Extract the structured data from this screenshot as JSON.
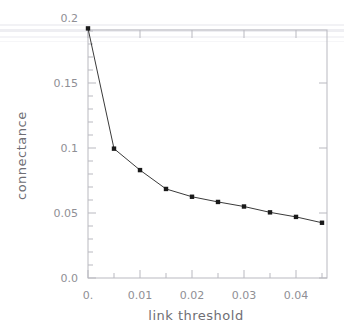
{
  "header": {
    "cut_text": "",
    "right_mark": ""
  },
  "chart_data": {
    "type": "line",
    "title": "",
    "xlabel": "link threshold",
    "ylabel": "connectance",
    "x": [
      0.0,
      0.005,
      0.01,
      0.015,
      0.02,
      0.025,
      0.03,
      0.035,
      0.04,
      0.045
    ],
    "values": [
      0.192,
      0.0995,
      0.083,
      0.0685,
      0.0625,
      0.0585,
      0.055,
      0.0505,
      0.047,
      0.0425
    ],
    "series": [
      {
        "name": "connectance",
        "values": [
          0.192,
          0.0995,
          0.083,
          0.0685,
          0.0625,
          0.0585,
          0.055,
          0.0505,
          0.047,
          0.0425
        ]
      }
    ],
    "xlim": [
      -0.004,
      0.0465
    ],
    "ylim": [
      0.0,
      0.2
    ],
    "xticks": [
      0.0,
      0.01,
      0.02,
      0.03,
      0.04
    ],
    "xtick_labels": [
      "0.",
      "0.01",
      "0.02",
      "0.03",
      "0.04"
    ],
    "xminor_ticks": [
      0.005,
      0.015,
      0.025,
      0.035,
      0.045
    ],
    "yticks": [
      0.0,
      0.05,
      0.1,
      0.15,
      0.2
    ],
    "ytick_labels": [
      "0.0",
      "0.05",
      "0.1",
      "0.15",
      "0.2"
    ],
    "yminor_ticks": [
      0.01,
      0.02,
      0.03,
      0.04,
      0.06,
      0.07,
      0.08,
      0.09,
      0.11,
      0.12,
      0.13,
      0.14,
      0.16,
      0.17,
      0.18,
      0.19
    ],
    "grid": false,
    "legend": false,
    "marker": "square",
    "line_color": "#3a3a3a",
    "marker_color": "#1a1a1a",
    "axis_color": "#b9b9c0",
    "label_color": "#8f8f95",
    "background": "#ffffff"
  }
}
